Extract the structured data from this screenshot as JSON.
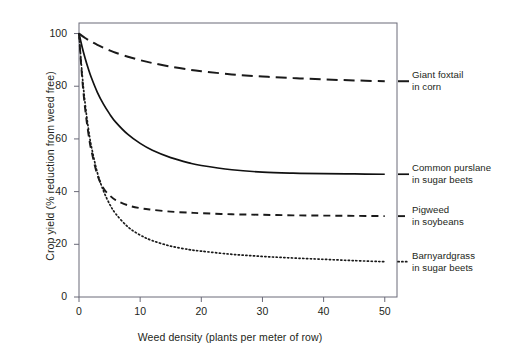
{
  "chart_data": {
    "type": "line",
    "title": "",
    "xlabel": "Weed density (plants per meter of row)",
    "ylabel": "Crop yield (% reduction from weed free)",
    "xlim": [
      0,
      52
    ],
    "ylim": [
      0,
      104
    ],
    "xticks": [
      0,
      10,
      20,
      30,
      40,
      50
    ],
    "yticks": [
      0,
      20,
      40,
      60,
      80,
      100
    ],
    "xtick_labels": [
      "0",
      "10",
      "20",
      "30",
      "40",
      "50"
    ],
    "ytick_labels": [
      "0",
      "20",
      "40",
      "60",
      "80",
      "100"
    ],
    "grid": false,
    "legend_position": "right-of-axes",
    "x": [
      0,
      0.5,
      1,
      1.5,
      2,
      3,
      4,
      5,
      6,
      8,
      10,
      12,
      15,
      18,
      20,
      25,
      30,
      35,
      40,
      45,
      50
    ],
    "series": [
      {
        "name": "Giant foxtail in corn",
        "label_line1": "Giant foxtail",
        "label_line2": "in corn",
        "style": "dashed",
        "color": "#1a1a1a",
        "values": [
          100,
          99.1,
          98.3,
          97.6,
          96.9,
          95.7,
          94.6,
          93.6,
          92.7,
          91.2,
          89.9,
          88.8,
          87.4,
          86.3,
          85.7,
          84.5,
          83.7,
          83.1,
          82.6,
          82.2,
          81.9
        ]
      },
      {
        "name": "Common purslane in sugar beets",
        "label_line1": "Common purslane",
        "label_line2": "in sugar beets",
        "style": "solid",
        "color": "#111111",
        "values": [
          100,
          95.0,
          90.6,
          86.8,
          83.4,
          77.7,
          73.2,
          69.5,
          66.4,
          61.7,
          58.3,
          55.7,
          52.9,
          50.9,
          49.9,
          48.3,
          47.4,
          47.0,
          46.8,
          46.7,
          46.6
        ]
      },
      {
        "name": "Pigweed in soybeans",
        "label_line1": "Pigweed",
        "label_line2": "in soybeans",
        "style": "dashed-short",
        "color": "#1a1a1a",
        "values": [
          100,
          83.5,
          71.5,
          62.6,
          55.8,
          46.4,
          41.3,
          38.6,
          36.8,
          34.8,
          33.7,
          33.1,
          32.4,
          32.0,
          31.8,
          31.4,
          31.2,
          31.0,
          30.9,
          30.8,
          30.7
        ]
      },
      {
        "name": "Barnyardgrass in sugar beets",
        "label_line1": "Barnyardgrass",
        "label_line2": "in sugar beets",
        "style": "dotted",
        "color": "#1a1a1a",
        "values": [
          100,
          85.0,
          73.5,
          64.5,
          57.4,
          47.2,
          40.3,
          35.3,
          31.6,
          26.6,
          23.5,
          21.4,
          19.3,
          18.0,
          17.4,
          16.2,
          15.4,
          14.8,
          14.3,
          13.8,
          13.4
        ]
      }
    ]
  }
}
